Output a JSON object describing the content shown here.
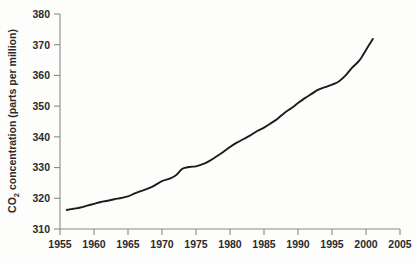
{
  "chart_data": {
    "type": "line",
    "title": "",
    "xlabel": "",
    "ylabel": "CO2 concentration (parts per million)",
    "ylabel_parts": {
      "prefix": "CO",
      "subscript": "2",
      "suffix": " concentration (parts per million)"
    },
    "xlim": [
      1955,
      2005
    ],
    "ylim": [
      310,
      380
    ],
    "grid": false,
    "legend": null,
    "xticks": [
      1955,
      1960,
      1965,
      1970,
      1975,
      1980,
      1985,
      1990,
      1995,
      2000,
      2005
    ],
    "yticks": [
      310,
      320,
      330,
      340,
      350,
      360,
      370,
      380
    ],
    "series": [
      {
        "name": "Atmospheric CO2",
        "color": "#1c1c1c",
        "x": [
          1956,
          1957,
          1958,
          1959,
          1960,
          1961,
          1962,
          1963,
          1964,
          1965,
          1966,
          1967,
          1968,
          1969,
          1970,
          1971,
          1972,
          1973,
          1974,
          1975,
          1976,
          1977,
          1978,
          1979,
          1980,
          1981,
          1982,
          1983,
          1984,
          1985,
          1986,
          1987,
          1988,
          1989,
          1990,
          1991,
          1992,
          1993,
          1994,
          1995,
          1996,
          1997,
          1998,
          1999,
          2000,
          2001
        ],
        "values": [
          316.2,
          316.6,
          317.0,
          317.6,
          318.2,
          318.8,
          319.2,
          319.7,
          320.1,
          320.6,
          321.6,
          322.4,
          323.2,
          324.3,
          325.6,
          326.3,
          327.4,
          329.6,
          330.2,
          330.4,
          331.1,
          332.2,
          333.6,
          335.1,
          336.7,
          338.1,
          339.3,
          340.5,
          341.9,
          343.0,
          344.4,
          345.9,
          347.8,
          349.3,
          351.0,
          352.6,
          354.0,
          355.4,
          356.2,
          357.0,
          358.0,
          360.0,
          362.6,
          364.8,
          368.3,
          371.9
        ]
      }
    ],
    "axis_color": "#8a8a88",
    "background_color": "#fdfdfc"
  }
}
